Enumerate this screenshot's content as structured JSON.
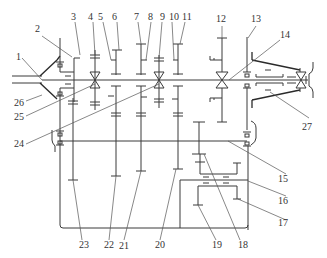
{
  "diagram": {
    "type": "transmission-kinematic-scheme",
    "line_color": "#3a3a3a",
    "labels": [
      {
        "id": "1",
        "text": "1"
      },
      {
        "id": "2",
        "text": "2"
      },
      {
        "id": "3",
        "text": "3"
      },
      {
        "id": "4",
        "text": "4"
      },
      {
        "id": "5",
        "text": "5"
      },
      {
        "id": "6",
        "text": "6"
      },
      {
        "id": "7",
        "text": "7"
      },
      {
        "id": "8",
        "text": "8"
      },
      {
        "id": "9",
        "text": "9"
      },
      {
        "id": "10",
        "text": "10"
      },
      {
        "id": "11",
        "text": "11"
      },
      {
        "id": "12",
        "text": "12"
      },
      {
        "id": "13",
        "text": "13"
      },
      {
        "id": "14",
        "text": "14"
      },
      {
        "id": "15",
        "text": "15"
      },
      {
        "id": "16",
        "text": "16"
      },
      {
        "id": "17",
        "text": "17"
      },
      {
        "id": "18",
        "text": "18"
      },
      {
        "id": "19",
        "text": "19"
      },
      {
        "id": "20",
        "text": "20"
      },
      {
        "id": "21",
        "text": "21"
      },
      {
        "id": "22",
        "text": "22"
      },
      {
        "id": "23",
        "text": "23"
      },
      {
        "id": "24",
        "text": "24"
      },
      {
        "id": "25",
        "text": "25"
      },
      {
        "id": "26",
        "text": "26"
      },
      {
        "id": "27",
        "text": "27"
      }
    ]
  }
}
